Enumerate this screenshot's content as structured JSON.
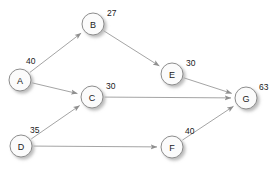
{
  "diagram": {
    "type": "directed-graph",
    "width": 280,
    "height": 175,
    "colors": {
      "background": "#ffffff",
      "node_fill": "#fbfbfb",
      "node_stroke": "#8c8c8c",
      "edge": "#9a9a9a",
      "text": "#1a1a1a",
      "shadow": "#c8c8c8"
    },
    "nodes": [
      {
        "id": "A",
        "label": "A",
        "value": "40",
        "cx": 20,
        "cy": 80,
        "r": 11,
        "value_x": 26,
        "value_y": 61
      },
      {
        "id": "B",
        "label": "B",
        "value": "27",
        "cx": 93,
        "cy": 24,
        "r": 11,
        "value_x": 107,
        "value_y": 13
      },
      {
        "id": "C",
        "label": "C",
        "value": "30",
        "cx": 92,
        "cy": 97,
        "r": 11,
        "value_x": 106,
        "value_y": 86
      },
      {
        "id": "D",
        "label": "D",
        "value": "35",
        "cx": 21,
        "cy": 146,
        "r": 11,
        "value_x": 30,
        "value_y": 130
      },
      {
        "id": "E",
        "label": "E",
        "value": "30",
        "cx": 172,
        "cy": 74,
        "r": 11,
        "value_x": 186,
        "value_y": 63
      },
      {
        "id": "F",
        "label": "F",
        "value": "40",
        "cx": 172,
        "cy": 147,
        "r": 11,
        "value_x": 185,
        "value_y": 131
      },
      {
        "id": "G",
        "label": "G",
        "value": "63",
        "cx": 246,
        "cy": 98,
        "r": 11,
        "value_x": 259,
        "value_y": 87
      }
    ],
    "edges": [
      {
        "from": "A",
        "to": "B",
        "name": "edge-a-b"
      },
      {
        "from": "A",
        "to": "C",
        "name": "edge-a-c"
      },
      {
        "from": "B",
        "to": "E",
        "name": "edge-b-e"
      },
      {
        "from": "D",
        "to": "C",
        "name": "edge-d-c"
      },
      {
        "from": "D",
        "to": "F",
        "name": "edge-d-f"
      },
      {
        "from": "C",
        "to": "G",
        "name": "edge-c-g"
      },
      {
        "from": "E",
        "to": "G",
        "name": "edge-e-g"
      },
      {
        "from": "F",
        "to": "G",
        "name": "edge-f-g"
      }
    ]
  }
}
